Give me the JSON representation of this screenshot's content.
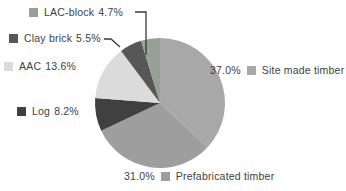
{
  "chart_data": {
    "type": "pie",
    "title": "",
    "unit": "%",
    "direction": "clockwise",
    "start_angle_deg": 0,
    "legend_position": "callouts-around-pie",
    "slices": [
      {
        "key": "site",
        "label": "Site made timber",
        "value": 37.0,
        "display": "37.0%",
        "color": "#a8a8a8"
      },
      {
        "key": "prefab",
        "label": "Prefabricated timber",
        "value": 31.0,
        "display": "31.0%",
        "color": "#9e9e9e"
      },
      {
        "key": "log",
        "label": "Log",
        "value": 8.2,
        "display": "8.2%",
        "color": "#404040"
      },
      {
        "key": "aac",
        "label": "AAC",
        "value": 13.6,
        "display": "13.6%",
        "color": "#dbdbdb"
      },
      {
        "key": "clay",
        "label": "Clay brick",
        "value": 5.5,
        "display": "5.5%",
        "color": "#575757"
      },
      {
        "key": "lac",
        "label": "LAC-block",
        "value": 4.7,
        "display": "4.7%",
        "color": "#95a096"
      }
    ],
    "annotation_text_color": "#3e3e3e",
    "background_color": "#ffffff"
  }
}
